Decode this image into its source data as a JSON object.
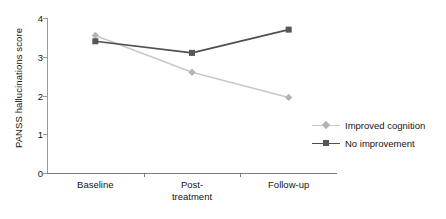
{
  "chart_data": {
    "type": "line",
    "title": "",
    "xlabel": "",
    "ylabel": "PANSS hallucinations score",
    "categories": [
      "Baseline",
      "Post-\ntreatment",
      "Follow-up"
    ],
    "category_labels": [
      {
        "line1": "Baseline",
        "line2": ""
      },
      {
        "line1": "Post-",
        "line2": "treatment"
      },
      {
        "line1": "Follow-up",
        "line2": ""
      }
    ],
    "ylim": [
      0,
      4
    ],
    "yticks": [
      0,
      1,
      2,
      3,
      4
    ],
    "ytick_labels": [
      "0",
      "1",
      "2",
      "3",
      "4"
    ],
    "grid": false,
    "legend_position": "right-middle",
    "series": [
      {
        "name": "Improved cognition",
        "values": [
          3.55,
          2.6,
          1.95
        ],
        "color": "#c8c8c8",
        "marker": "diamond",
        "marker_color": "#b4b4b4"
      },
      {
        "name": "No improvement",
        "values": [
          3.4,
          3.1,
          3.7
        ],
        "color": "#4f4f4f",
        "marker": "square",
        "marker_color": "#565656"
      }
    ]
  },
  "axis": {
    "line_color": "#8a8a8a"
  }
}
